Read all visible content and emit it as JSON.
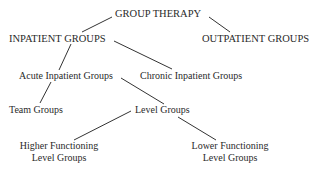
{
  "diagram": {
    "type": "tree",
    "line_color": "#333333",
    "nodes": {
      "root": "GROUP THERAPY",
      "inpatient": "INPATIENT GROUPS",
      "outpatient": "OUTPATIENT GROUPS",
      "acute": "Acute Inpatient Groups",
      "chronic": "Chronic Inpatient Groups",
      "team": "Team Groups",
      "level": "Level Groups",
      "higher_line1": "Higher Functioning",
      "higher_line2": "Level Groups",
      "lower_line1": "Lower Functioning",
      "lower_line2": "Level Groups"
    },
    "edges": [
      [
        "GROUP THERAPY",
        "INPATIENT GROUPS"
      ],
      [
        "GROUP THERAPY",
        "OUTPATIENT GROUPS"
      ],
      [
        "INPATIENT GROUPS",
        "Acute Inpatient Groups"
      ],
      [
        "INPATIENT GROUPS",
        "Chronic Inpatient Groups"
      ],
      [
        "Acute Inpatient Groups",
        "Team Groups"
      ],
      [
        "Acute Inpatient Groups",
        "Level Groups"
      ],
      [
        "Level Groups",
        "Higher Functioning Level Groups"
      ],
      [
        "Level Groups",
        "Lower Functioning Level Groups"
      ]
    ]
  }
}
